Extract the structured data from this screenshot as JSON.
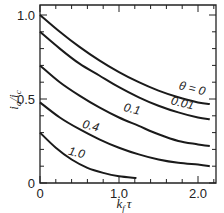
{
  "chart_data": {
    "type": "line",
    "title": "",
    "xlabel": "k_f τ",
    "ylabel": "i_a / i_c",
    "xlim": [
      0,
      2.3
    ],
    "ylim": [
      0,
      1.05
    ],
    "xticks": [
      0,
      1.0,
      2.0
    ],
    "xtick_labels": [
      "0",
      "1.0",
      "2.0"
    ],
    "yticks": [
      0,
      0.5,
      1.0
    ],
    "ytick_labels": [
      "0",
      "0.5",
      "1.0"
    ],
    "grid": false,
    "legend": "inline curve labels",
    "parameter": "θ",
    "series": [
      {
        "name": "θ = 0",
        "label": "θ = 0",
        "x": [
          0,
          0.25,
          0.5,
          0.75,
          1.0,
          1.25,
          1.5,
          1.75,
          2.0,
          2.15
        ],
        "y": [
          1.0,
          0.9,
          0.81,
          0.73,
          0.66,
          0.6,
          0.55,
          0.51,
          0.48,
          0.47
        ]
      },
      {
        "name": "θ = 0.01",
        "label": "0.01",
        "x": [
          0,
          0.25,
          0.5,
          0.75,
          1.0,
          1.25,
          1.5,
          1.75,
          2.0,
          2.15
        ],
        "y": [
          0.9,
          0.8,
          0.71,
          0.64,
          0.57,
          0.51,
          0.46,
          0.42,
          0.39,
          0.38
        ]
      },
      {
        "name": "θ = 0.1",
        "label": "0.1",
        "x": [
          0,
          0.25,
          0.5,
          0.75,
          1.0,
          1.25,
          1.5,
          1.75,
          2.0,
          2.15
        ],
        "y": [
          0.7,
          0.6,
          0.52,
          0.45,
          0.39,
          0.34,
          0.29,
          0.25,
          0.23,
          0.22
        ]
      },
      {
        "name": "θ = 0.4",
        "label": "0.4",
        "x": [
          0,
          0.25,
          0.5,
          0.75,
          1.0,
          1.25,
          1.5,
          1.75,
          2.0,
          2.15
        ],
        "y": [
          0.48,
          0.39,
          0.32,
          0.26,
          0.21,
          0.17,
          0.14,
          0.12,
          0.11,
          0.1
        ]
      },
      {
        "name": "θ = 1.0",
        "label": "1.0",
        "x": [
          0,
          0.2,
          0.4,
          0.6,
          0.8,
          1.0,
          1.22
        ],
        "y": [
          0.3,
          0.21,
          0.14,
          0.09,
          0.06,
          0.04,
          0.03
        ]
      }
    ],
    "label_positions": [
      {
        "x": 1.75,
        "y": 0.56,
        "rotate": 14
      },
      {
        "x": 1.65,
        "y": 0.47,
        "rotate": 14
      },
      {
        "x": 1.05,
        "y": 0.43,
        "rotate": 14
      },
      {
        "x": 0.53,
        "y": 0.33,
        "rotate": 14
      },
      {
        "x": 0.35,
        "y": 0.17,
        "rotate": 14
      }
    ]
  },
  "axes": {
    "x_title": "k",
    "x_title_sub": "f",
    "x_title_rest": "τ",
    "y_title": "i",
    "y_title_sub_a": "a",
    "y_title_mid": "/i",
    "y_title_sub_c": "c"
  }
}
